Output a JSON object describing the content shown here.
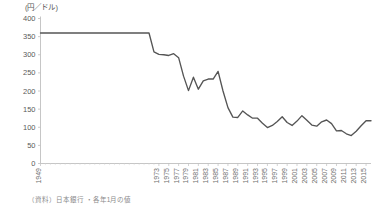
{
  "chart_data": {
    "type": "line",
    "title": "",
    "unit_label": "(円／ドル)",
    "xlabel": "",
    "ylabel": "",
    "ylim": [
      0,
      400
    ],
    "ytick_step": 50,
    "yticks": [
      0,
      50,
      100,
      150,
      200,
      250,
      300,
      350,
      400
    ],
    "grid": false,
    "legend": false,
    "line_color": "#555555",
    "axis_color": "#bfbfbf",
    "xtick_labels": [
      "1949",
      "1973",
      "1975",
      "1977",
      "1979",
      "1981",
      "1983",
      "1985",
      "1987",
      "1989",
      "1991",
      "1993",
      "1995",
      "1997",
      "1999",
      "2001",
      "2003",
      "2005",
      "2007",
      "2009",
      "2011",
      "2013",
      "2015"
    ],
    "xlim": [
      1949,
      2016
    ],
    "source": "（資料）日本銀行 ・各年1月の値",
    "series": [
      {
        "name": "円／ドル為替レート",
        "x": [
          1949,
          1950,
          1951,
          1952,
          1953,
          1954,
          1955,
          1956,
          1957,
          1958,
          1959,
          1960,
          1961,
          1962,
          1963,
          1964,
          1965,
          1966,
          1967,
          1968,
          1969,
          1970,
          1971,
          1972,
          1973,
          1974,
          1975,
          1976,
          1977,
          1978,
          1979,
          1980,
          1981,
          1982,
          1983,
          1984,
          1985,
          1986,
          1987,
          1988,
          1989,
          1990,
          1991,
          1992,
          1993,
          1994,
          1995,
          1996,
          1997,
          1998,
          1999,
          2000,
          2001,
          2002,
          2003,
          2004,
          2005,
          2006,
          2007,
          2008,
          2009,
          2010,
          2011,
          2012,
          2013,
          2014,
          2015,
          2016
        ],
        "values": [
          360,
          360,
          360,
          360,
          360,
          360,
          360,
          360,
          360,
          360,
          360,
          360,
          360,
          360,
          360,
          360,
          360,
          360,
          360,
          360,
          360,
          360,
          360,
          308,
          301,
          300,
          298,
          303,
          292,
          241,
          201,
          238,
          205,
          228,
          233,
          233,
          254,
          200,
          154,
          128,
          127,
          145,
          134,
          125,
          125,
          111,
          99,
          105,
          116,
          129,
          113,
          105,
          117,
          132,
          119,
          106,
          103,
          115,
          120,
          110,
          90,
          91,
          82,
          77,
          89,
          104,
          118,
          118
        ]
      }
    ]
  }
}
